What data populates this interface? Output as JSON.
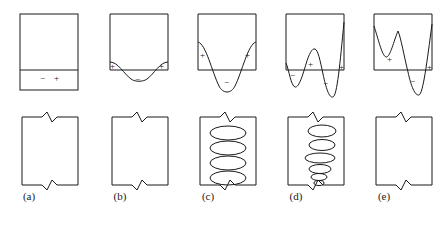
{
  "figure": {
    "width": 444,
    "height": 227,
    "background": "#ffffff",
    "stroke_color": "#1a1a1a"
  },
  "panels": [
    {
      "id": "a",
      "label": "(a)",
      "top": {
        "type": "flat-line",
        "box": {
          "x": 20,
          "y": 14,
          "w": 58,
          "h": 76
        },
        "baseline_y": 70,
        "signs": [
          {
            "text": "−",
            "x": 40,
            "y": 81
          },
          {
            "text": "+",
            "x": 54,
            "y": 81
          }
        ]
      },
      "bottom": {
        "box": {
          "x": 22,
          "y": 117,
          "w": 56,
          "h": 68
        },
        "ellipses": []
      }
    },
    {
      "id": "b",
      "label": "(b)",
      "top": {
        "type": "single-shallow-dip",
        "box": {
          "x": 110,
          "y": 14,
          "w": 58,
          "h": 56
        },
        "baseline_y": 70,
        "signs": [
          {
            "text": "+",
            "x": 113,
            "y": 68
          },
          {
            "text": "−",
            "x": 137,
            "y": 82
          },
          {
            "text": "+",
            "x": 161,
            "y": 68
          }
        ]
      },
      "bottom": {
        "box": {
          "x": 112,
          "y": 117,
          "w": 56,
          "h": 68
        },
        "ellipses": []
      }
    },
    {
      "id": "c",
      "label": "(c)",
      "top": {
        "type": "single-deep-dip",
        "box": {
          "x": 198,
          "y": 14,
          "w": 58,
          "h": 56
        },
        "baseline_y": 70,
        "signs": [
          {
            "text": "+",
            "x": 203,
            "y": 58
          },
          {
            "text": "−",
            "x": 226,
            "y": 85
          },
          {
            "text": "+",
            "x": 248,
            "y": 58
          }
        ]
      },
      "bottom": {
        "box": {
          "x": 200,
          "y": 117,
          "w": 56,
          "h": 68
        },
        "ellipses": [
          {
            "cx": 228,
            "cy": 133,
            "rx": 18,
            "ry": 7
          },
          {
            "cx": 228,
            "cy": 148,
            "rx": 18,
            "ry": 7
          },
          {
            "cx": 228,
            "cy": 163,
            "rx": 18,
            "ry": 7
          },
          {
            "cx": 228,
            "cy": 178,
            "rx": 18,
            "ry": 7
          }
        ]
      }
    },
    {
      "id": "d",
      "label": "(d)",
      "top": {
        "type": "double-trough-center-peak",
        "box": {
          "x": 286,
          "y": 14,
          "w": 58,
          "h": 56
        },
        "baseline_y": 70,
        "signs": [
          {
            "text": "−",
            "x": 292,
            "y": 78
          },
          {
            "text": "+",
            "x": 310,
            "y": 65
          },
          {
            "text": "−",
            "x": 325,
            "y": 85
          },
          {
            "text": "+",
            "x": 341,
            "y": 70
          }
        ]
      },
      "bottom": {
        "box": {
          "x": 288,
          "y": 117,
          "w": 56,
          "h": 68
        },
        "ellipses": [
          {
            "cx": 322,
            "cy": 131,
            "rx": 14,
            "ry": 6
          },
          {
            "cx": 322,
            "cy": 145,
            "rx": 13,
            "ry": 5.5
          },
          {
            "cx": 320,
            "cy": 158,
            "rx": 15,
            "ry": 5
          },
          {
            "cx": 320,
            "cy": 169,
            "rx": 11,
            "ry": 4.5
          },
          {
            "cx": 319,
            "cy": 177,
            "rx": 8,
            "ry": 3.5
          },
          {
            "cx": 319,
            "cy": 183,
            "rx": 5,
            "ry": 2.5
          }
        ]
      }
    },
    {
      "id": "e",
      "label": "(e)",
      "top": {
        "type": "w-shape-deep-right-trough",
        "box": {
          "x": 374,
          "y": 14,
          "w": 58,
          "h": 56
        },
        "baseline_y": 70,
        "signs": [
          {
            "text": "+",
            "x": 390,
            "y": 62
          },
          {
            "text": "−",
            "x": 412,
            "y": 83
          },
          {
            "text": "+",
            "x": 429,
            "y": 70
          }
        ]
      },
      "bottom": {
        "box": {
          "x": 376,
          "y": 117,
          "w": 56,
          "h": 68
        },
        "ellipses": []
      }
    }
  ],
  "labels_row": {
    "y": 196,
    "items": [
      {
        "text": "(a)",
        "x": 29
      },
      {
        "text": "(b)",
        "x": 120
      },
      {
        "text": "(c)",
        "x": 208
      },
      {
        "text": "(d)",
        "x": 296
      },
      {
        "text": "(e)",
        "x": 384
      }
    ]
  }
}
